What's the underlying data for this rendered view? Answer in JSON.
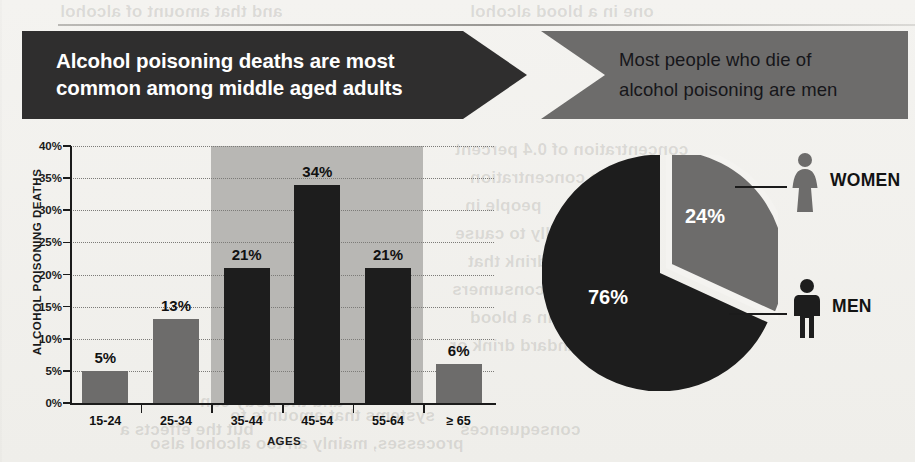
{
  "header": {
    "left_banner": {
      "line1": "Alcohol poisoning deaths are most",
      "line2": "common among middle aged adults",
      "bg": "#2f2e2e",
      "fg": "#ffffff"
    },
    "right_banner": {
      "line1": "Most people who die of",
      "line2": "alcohol poisoning are men",
      "bg": "#6d6c6b",
      "fg": "#16161a"
    }
  },
  "chart_data": [
    {
      "type": "bar",
      "title": "Alcohol poisoning deaths are most common among middle aged adults",
      "xlabel": "AGES",
      "ylabel": "ALCOHOL POISONING DEATHS",
      "categories": [
        "15-24",
        "25-34",
        "35-44",
        "45-54",
        "55-64",
        "≥ 65"
      ],
      "values": [
        5,
        13,
        21,
        34,
        21,
        6
      ],
      "data_labels": [
        "5%",
        "13%",
        "21%",
        "34%",
        "21%",
        "6%"
      ],
      "bar_colors": [
        "#6d6c6b",
        "#6d6c6b",
        "#1d1d1d",
        "#1d1d1d",
        "#1d1d1d",
        "#6d6c6b"
      ],
      "ylim": [
        0,
        40
      ],
      "yticks": [
        0,
        5,
        10,
        15,
        20,
        25,
        30,
        35,
        40
      ],
      "ytick_labels": [
        "0%",
        "5%",
        "10%",
        "15%",
        "20%",
        "25%",
        "30%",
        "35%",
        "40%"
      ],
      "grid": true,
      "highlight_band": {
        "categories": [
          "35-44",
          "45-54",
          "55-64"
        ],
        "color": "#b8b7b4"
      },
      "legend": ""
    },
    {
      "type": "pie",
      "title": "Most people who die of alcohol poisoning are men",
      "labels": [
        "MEN",
        "WOMEN"
      ],
      "values": [
        76,
        24
      ],
      "data_labels": [
        "76%",
        "24%"
      ],
      "slice_colors": [
        "#1d1d1d",
        "#6d6c6b"
      ],
      "exploded": [
        "WOMEN"
      ],
      "legend": "right",
      "icons": [
        "man-icon",
        "woman-icon"
      ]
    }
  ],
  "bleed_text": [
    "and that amount of alcohol",
    "one in a blood alcohol",
    "concentration of 0.4 percent",
    "also in concentration",
    "people in",
    "typically to cause",
    "of drink that",
    "most consumers",
    "is in a blood",
    "a standard drink or",
    "and the body can",
    "but the effects a",
    "consequences",
    "systems that amounts to",
    "processes, mainly an too alcohol also",
    "is responsible for other"
  ]
}
